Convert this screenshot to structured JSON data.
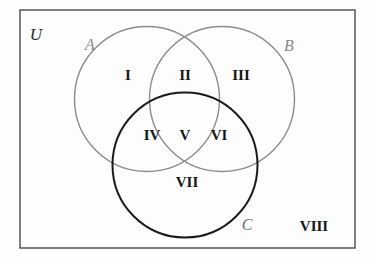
{
  "figure": {
    "type": "venn-diagram",
    "background_color": "#fdfdfd",
    "canvas": {
      "width": 375,
      "height": 263
    }
  },
  "universe": {
    "label": "U",
    "label_x": 36,
    "label_y": 36,
    "font_size": 17,
    "color": "#262626",
    "rect": {
      "x": 20,
      "y": 10,
      "width": 335,
      "height": 238
    },
    "stroke_color": "#4a4a4a",
    "stroke_width": 1.4
  },
  "sets": [
    {
      "name": "A",
      "label": "A",
      "cx": 147,
      "cy": 99,
      "r": 72.5,
      "stroke_color": "#8c8c8c",
      "stroke_width": 1.4,
      "label_x": 90,
      "label_y": 46,
      "label_color": "#8a8a8a",
      "font_size": 16
    },
    {
      "name": "B",
      "label": "B",
      "cx": 222,
      "cy": 99,
      "r": 72.5,
      "stroke_color": "#8c8c8c",
      "stroke_width": 1.4,
      "label_x": 289,
      "label_y": 47,
      "label_color": "#8a8a8a",
      "font_size": 16
    },
    {
      "name": "C",
      "label": "C",
      "cx": 185,
      "cy": 165,
      "r": 72.5,
      "stroke_color": "#1a1a1a",
      "stroke_width": 2.0,
      "label_x": 247,
      "label_y": 226,
      "label_color": "#6f6f6f",
      "font_size": 16
    }
  ],
  "regions": [
    {
      "id": "I",
      "label": "I",
      "x": 128,
      "y": 77,
      "description": "A only"
    },
    {
      "id": "II",
      "label": "II",
      "x": 185,
      "y": 77,
      "description": "A and B only"
    },
    {
      "id": "III",
      "label": "III",
      "x": 241,
      "y": 77,
      "description": "B only"
    },
    {
      "id": "IV",
      "label": "IV",
      "x": 152,
      "y": 137,
      "description": "A and C only"
    },
    {
      "id": "V",
      "label": "V",
      "x": 185,
      "y": 137,
      "description": "A and B and C"
    },
    {
      "id": "VI",
      "label": "VI",
      "x": 219,
      "y": 137,
      "description": "B and C only"
    },
    {
      "id": "VII",
      "label": "VII",
      "x": 187,
      "y": 184,
      "description": "C only"
    },
    {
      "id": "VIII",
      "label": "VIII",
      "x": 314,
      "y": 228,
      "description": "outside all sets"
    }
  ],
  "region_style": {
    "font_size": 15,
    "color": "#161616"
  }
}
